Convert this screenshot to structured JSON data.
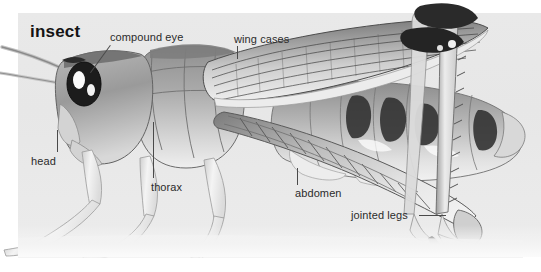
{
  "figure": {
    "title": "insect",
    "background_color": "#ffffff",
    "panel_color": "#e9e9e9",
    "label_color": "#2b2b2b",
    "leader_color": "#4a4a4a"
  },
  "labels": [
    {
      "id": "compound-eye",
      "text": "compound eye"
    },
    {
      "id": "wing-cases",
      "text": "wing cases"
    },
    {
      "id": "head",
      "text": "head"
    },
    {
      "id": "thorax",
      "text": "thorax"
    },
    {
      "id": "abdomen",
      "text": "abdomen"
    },
    {
      "id": "jointed-legs",
      "text": "jointed legs"
    }
  ]
}
